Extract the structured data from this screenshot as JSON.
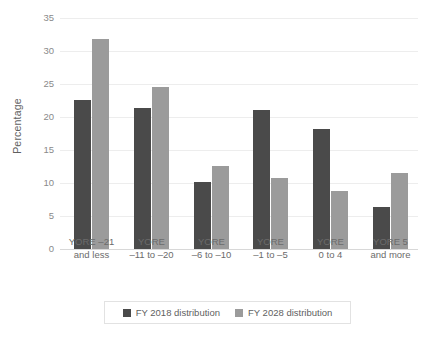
{
  "chart_data": {
    "type": "bar",
    "title": "",
    "xlabel": "",
    "ylabel": "Percentage",
    "ylim": [
      0,
      35
    ],
    "ytick_step": 5,
    "yticks": [
      0,
      5,
      10,
      15,
      20,
      25,
      30,
      35
    ],
    "ytick_labels": [
      "0",
      "5",
      "10",
      "15",
      "20",
      "25",
      "30",
      "35"
    ],
    "grid": true,
    "legend_position": "bottom",
    "categories": [
      "YORE –21 and less",
      "YORE –11 to –20",
      "YORE –6 to –10",
      "YORE –1 to –5",
      "YORE 0 to 4",
      "YORE 5 and more"
    ],
    "category_lines": [
      [
        "YORE –21",
        "and less"
      ],
      [
        "YORE",
        "–11 to –20"
      ],
      [
        "YORE",
        "–6 to –10"
      ],
      [
        "YORE",
        "–1 to –5"
      ],
      [
        "YORE",
        "0 to 4"
      ],
      [
        "YORE 5",
        "and more"
      ]
    ],
    "series": [
      {
        "name": "FY 2018 distribution",
        "color": "#4a4a4a",
        "values": [
          22.6,
          21.4,
          10.2,
          21.0,
          18.2,
          6.4
        ]
      },
      {
        "name": "FY 2028 distribution",
        "color": "#9b9b9b",
        "values": [
          31.8,
          24.5,
          12.6,
          10.7,
          8.8,
          11.5
        ]
      }
    ]
  },
  "colors": {
    "series_2018": "#4a4a4a",
    "series_2028": "#9b9b9b",
    "gridline": "#ededed",
    "baseline": "#d8d8d8",
    "text": "#6b6b6b",
    "background": "#ffffff"
  },
  "legend": {
    "items": [
      {
        "label": "FY 2018 distribution",
        "color": "#4a4a4a"
      },
      {
        "label": "FY 2028 distribution",
        "color": "#9b9b9b"
      }
    ]
  }
}
